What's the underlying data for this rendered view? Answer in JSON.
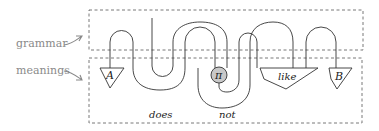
{
  "figure": {
    "labels": {
      "grammar": "grammar",
      "meanings": "meanings"
    },
    "boxes": {
      "A": "A",
      "like": "like",
      "B": "B"
    },
    "spider": {
      "symbol": "π",
      "fill": "#c8c8c8"
    },
    "words": {
      "does": "does",
      "not": "not"
    }
  }
}
